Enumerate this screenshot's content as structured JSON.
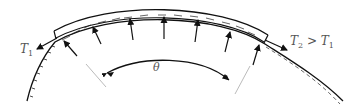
{
  "diagram": {
    "type": "belt-friction-capstan",
    "labels": {
      "tension_left": "T",
      "tension_left_sub": "1",
      "tension_right": "T",
      "tension_right_sub": "2",
      "tension_relation": " > ",
      "tension_right_compare": "T",
      "tension_right_compare_sub": "1",
      "angle": "θ"
    },
    "colors": {
      "stroke": "#111111",
      "label": "#555555",
      "radial_line": "#bbbbbb",
      "background": "#ffffff"
    },
    "normal_force_arrows": 7
  }
}
